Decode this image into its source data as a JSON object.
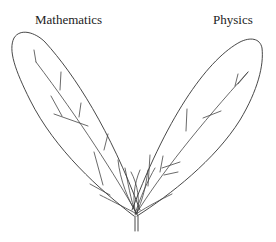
{
  "diagram": {
    "labels": {
      "left": "Mathematics",
      "right": "Physics"
    },
    "colors": {
      "stroke": "#333333",
      "background": "#ffffff"
    }
  }
}
